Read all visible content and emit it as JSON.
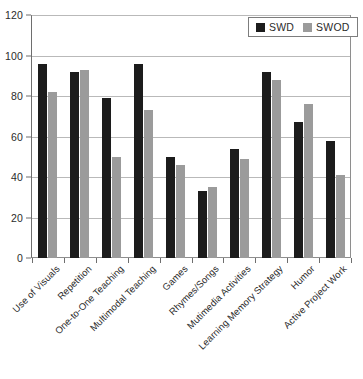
{
  "chart_data": {
    "type": "bar",
    "title": "",
    "xlabel": "",
    "ylabel": "",
    "ylim": [
      0,
      120
    ],
    "yticks": [
      0,
      20,
      40,
      60,
      80,
      100,
      120
    ],
    "grid": true,
    "legend_position": "top-right",
    "categories": [
      "Use of Visuals",
      "Repetition",
      "One-to-One Teaching",
      "Multimodal Teaching",
      "Games",
      "Rhymes/Songs",
      "Mutimedia Activities",
      "Learning Memory Strategy",
      "Humor",
      "Active Project Work"
    ],
    "series": [
      {
        "name": "SWD",
        "color": "#1c1c1c",
        "values": [
          96,
          92,
          79,
          96,
          50,
          33,
          54,
          92,
          67,
          58
        ]
      },
      {
        "name": "SWOD",
        "color": "#9b9b9b",
        "values": [
          82,
          93,
          50,
          73,
          46,
          35,
          49,
          88,
          76,
          41
        ]
      }
    ]
  },
  "legend": {
    "items": [
      {
        "label": "SWD",
        "swatch": "swd"
      },
      {
        "label": "SWOD",
        "swatch": "swod"
      }
    ]
  }
}
